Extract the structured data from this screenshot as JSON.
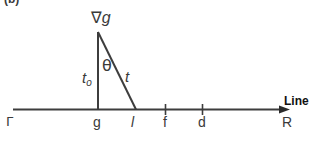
{
  "figure": {
    "panel_label": "(b)",
    "gradient_label": {
      "symbol": "∇",
      "variable": "g"
    },
    "triangle": {
      "vertical_side_label": "t",
      "vertical_side_subscript": "o",
      "angle_label": "θ",
      "hypotenuse_label": "t"
    },
    "axis": {
      "name": "Line",
      "points": [
        {
          "id": "Gamma",
          "label": "Γ"
        },
        {
          "id": "g",
          "label": "g"
        },
        {
          "id": "l",
          "label": "l"
        },
        {
          "id": "f",
          "label": "f"
        },
        {
          "id": "d",
          "label": "d"
        },
        {
          "id": "R",
          "label": "R"
        }
      ]
    },
    "colors": {
      "line": "#3d3d3d",
      "text": "#3a3a3a"
    }
  }
}
